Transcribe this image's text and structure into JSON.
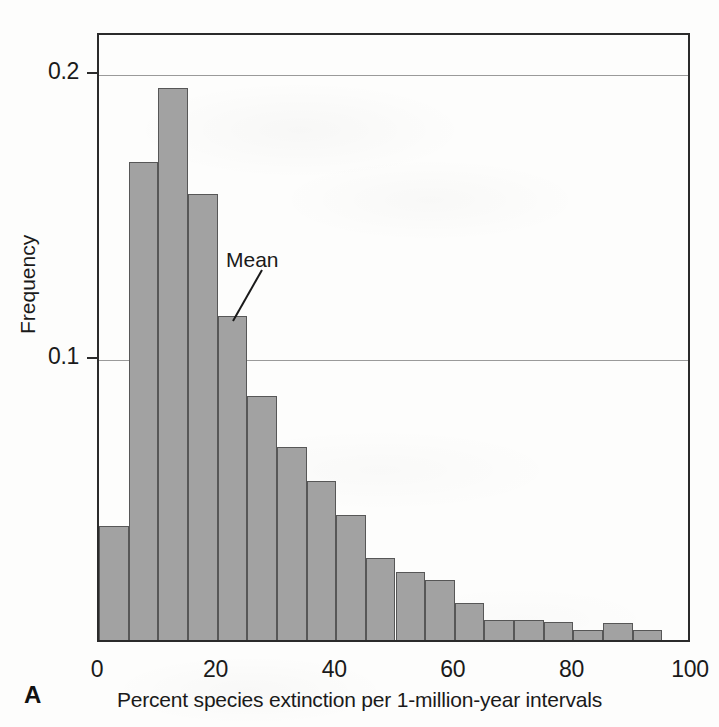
{
  "figure": {
    "panel_label": "A",
    "annotation": {
      "label": "Mean",
      "value": 25
    }
  },
  "chart_data": {
    "type": "bar",
    "title": "",
    "subtitle": "",
    "xlabel": "Percent species extinction per 1-million-year intervals",
    "ylabel": "Frequency",
    "xlim": [
      0,
      100
    ],
    "ylim": [
      0,
      0.2142
    ],
    "xticks": [
      0,
      20,
      40,
      60,
      80,
      100
    ],
    "xtick_labels": [
      "0",
      "20",
      "40",
      "60",
      "80",
      "100"
    ],
    "yticks": [
      0.1,
      0.2
    ],
    "ytick_labels": [
      "0.1",
      "0.2"
    ],
    "grid": "horizontal",
    "legend": "none",
    "bin_width": 5,
    "bar_color": "#a2a2a2",
    "bar_edge_color": "#575757",
    "categories": [
      "0-5",
      "5-10",
      "10-15",
      "15-20",
      "20-25",
      "25-30",
      "30-35",
      "35-40",
      "40-45",
      "45-50",
      "50-55",
      "55-60",
      "60-65",
      "65-70",
      "70-75",
      "75-80",
      "80-85",
      "85-90",
      "90-95"
    ],
    "bin_edges": [
      0,
      5,
      10,
      15,
      20,
      25,
      30,
      35,
      40,
      45,
      50,
      55,
      60,
      65,
      70,
      75,
      80,
      85,
      90,
      95
    ],
    "values": [
      0.04,
      0.168,
      0.194,
      0.157,
      0.114,
      0.086,
      0.068,
      0.056,
      0.044,
      0.029,
      0.024,
      0.021,
      0.013,
      0.007,
      0.007,
      0.0065,
      0.0035,
      0.006,
      0.0035
    ],
    "annotations": [
      {
        "text": "Mean",
        "x": 25,
        "y": 0.114
      }
    ]
  }
}
